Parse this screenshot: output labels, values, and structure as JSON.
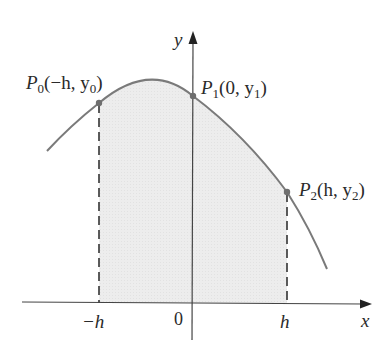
{
  "figure": {
    "axes": {
      "x_label": "x",
      "y_label": "y",
      "origin_label": "0",
      "ticks": [
        {
          "label": "−h"
        },
        {
          "label": "h"
        }
      ]
    },
    "points": [
      {
        "name": "P",
        "sub": "0",
        "coords": "(−h, y",
        "coord_sub": "0",
        "close": ")"
      },
      {
        "name": "P",
        "sub": "1",
        "coords": "(0, y",
        "coord_sub": "1",
        "close": ")"
      },
      {
        "name": "P",
        "sub": "2",
        "coords": "(h, y",
        "coord_sub": "2",
        "close": ")"
      }
    ],
    "colors": {
      "curve": "#7a7a7a",
      "fill": "#ececec",
      "axis": "#333333",
      "point": "#6e6e6e"
    }
  }
}
